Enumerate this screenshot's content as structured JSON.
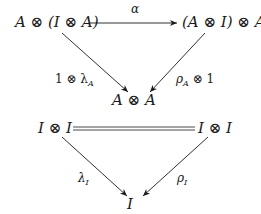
{
  "diagram_1": {
    "node_top_left": "A ⊗ (I ⊗ A)",
    "node_top_right": "(A ⊗ I) ⊗ A",
    "node_bottom": "A ⊗ A",
    "arrow_top_label": "α",
    "arrow_left_label_main": "1 ⊗ λ",
    "arrow_left_label_sub": "A",
    "arrow_right_label_main": "ρ",
    "arrow_right_label_sub": "A",
    "arrow_right_label_tail": " ⊗ 1"
  },
  "diagram_2": {
    "node_top_left": "I ⊗ I",
    "node_top_right": "I ⊗ I",
    "node_bottom": "I",
    "arrow_left_label_main": "λ",
    "arrow_left_label_sub": "I",
    "arrow_right_label_main": "ρ",
    "arrow_right_label_sub": "I"
  },
  "colors": {
    "ink": "#1a1a1a",
    "background": "#ffffff"
  }
}
